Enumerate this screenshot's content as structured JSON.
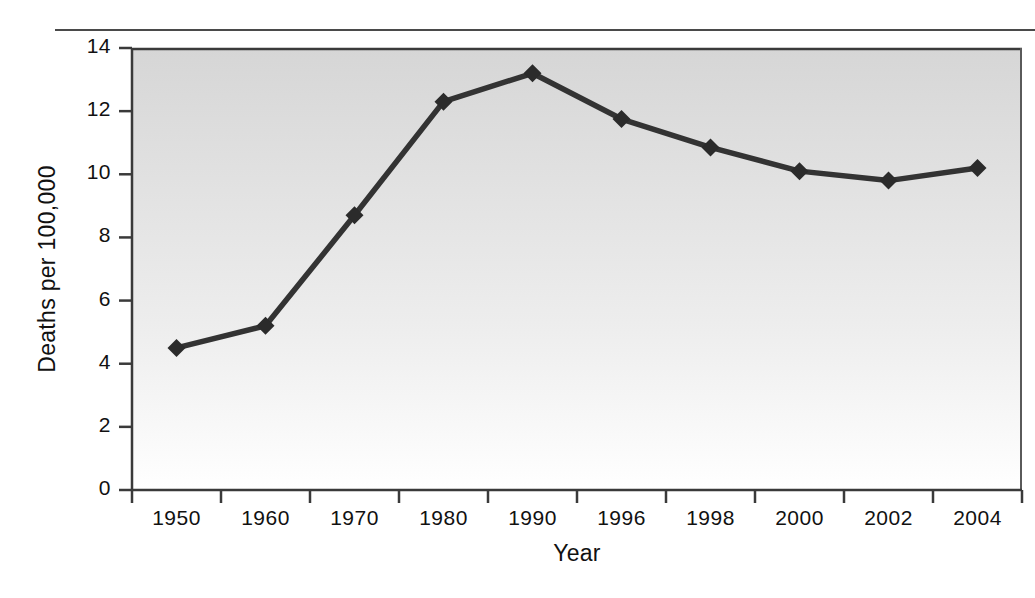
{
  "chart_data": {
    "type": "line",
    "title": "",
    "xlabel": "Year",
    "ylabel": "Deaths per 100,000",
    "categories": [
      "1950",
      "1960",
      "1970",
      "1980",
      "1990",
      "1996",
      "1998",
      "2000",
      "2002",
      "2004"
    ],
    "values": [
      4.5,
      5.2,
      8.7,
      12.3,
      13.2,
      11.75,
      10.85,
      10.1,
      9.8,
      10.2
    ],
    "series": [
      {
        "name": "Deaths per 100,000",
        "values": [
          4.5,
          5.2,
          8.7,
          12.3,
          13.2,
          11.75,
          10.85,
          10.1,
          9.8,
          10.2
        ]
      }
    ],
    "ylim": [
      0,
      14
    ],
    "yticks": [
      0,
      2,
      4,
      6,
      8,
      10,
      12,
      14
    ],
    "ytick_labels": [
      "0",
      "2",
      "4",
      "6",
      "8",
      "10",
      "12",
      "14"
    ],
    "grid": false,
    "legend": "none",
    "marker": "diamond",
    "line_color": "#333333",
    "marker_color": "#2b2b2b",
    "plot_background_top": "#d6d6d6",
    "plot_background_bottom": "#ffffff",
    "axis_color": "#3a3a3a"
  },
  "axis": {
    "y_title": "Deaths per 100,000",
    "x_title": "Year"
  }
}
